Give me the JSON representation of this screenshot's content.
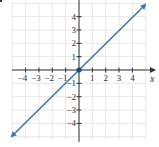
{
  "chart_data": {
    "type": "line",
    "title": "",
    "xlabel": "x",
    "ylabel": "",
    "xlim": [
      -5,
      5
    ],
    "ylim": [
      -5,
      5
    ],
    "grid": true,
    "x_ticks": [
      -4,
      -3,
      -2,
      -1,
      1,
      2,
      3,
      4
    ],
    "y_ticks": [
      -4,
      -3,
      -2,
      -1,
      1,
      2,
      3,
      4
    ],
    "x_tick_labels": [
      "−4",
      "−3",
      "−2",
      "−1",
      "1",
      "2",
      "3",
      "4"
    ],
    "y_tick_labels": [
      "−4",
      "−3",
      "−2",
      "−1",
      "1",
      "2",
      "3",
      "4"
    ],
    "series": [
      {
        "name": "y = x",
        "x": [
          -5,
          0,
          5
        ],
        "y": [
          -5,
          0,
          5
        ],
        "color": "#3a78b5",
        "arrows_both_ends": true
      }
    ],
    "points": [
      {
        "x": 0,
        "y": 0,
        "label": "origin",
        "color": "#1f4f82"
      }
    ]
  },
  "colors": {
    "line": "#3a78b5",
    "axis": "#333333",
    "grid": "#e6e6e6",
    "point": "#1f4f82"
  }
}
